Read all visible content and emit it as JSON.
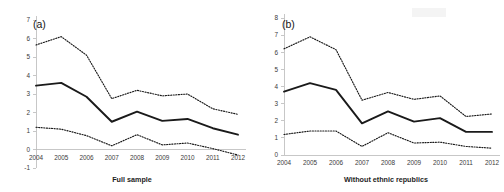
{
  "figure": {
    "width": 504,
    "height": 192,
    "background": "#ffffff",
    "line_color": "#1a1a1a",
    "axis_color": "#b9b9b9"
  },
  "panels": [
    {
      "tag": "(a)",
      "name": "panel-a",
      "caption": "Full sample"
    },
    {
      "tag": "(b)",
      "name": "panel-b",
      "caption": "Without ethnic republics"
    }
  ],
  "chart_data": [
    {
      "type": "line",
      "title": "(a)",
      "xlabel": "Full sample",
      "ylabel": "",
      "x": [
        2004,
        2005,
        2006,
        2007,
        2008,
        2009,
        2010,
        2011,
        2012
      ],
      "categories": [
        "2004",
        "2005",
        "2006",
        "2007",
        "2008",
        "2009",
        "2010",
        "2011",
        "2012"
      ],
      "xlim": [
        2004,
        2012
      ],
      "ylim": [
        -1,
        7
      ],
      "yticks": [
        -1,
        0,
        1,
        2,
        3,
        4,
        5,
        6,
        7
      ],
      "xticks": [
        "2004",
        "2005",
        "2006",
        "2007",
        "2008",
        "2009",
        "2010",
        "2011",
        "2012"
      ],
      "grid": false,
      "legend": "none",
      "series": [
        {
          "name": "Upper confidence bound",
          "style": "dotted",
          "values": [
            5.65,
            6.1,
            5.1,
            2.75,
            3.2,
            2.9,
            3.0,
            2.2,
            1.9
          ]
        },
        {
          "name": "Point estimate",
          "style": "solid",
          "values": [
            3.45,
            3.6,
            2.85,
            1.5,
            2.05,
            1.55,
            1.65,
            1.15,
            0.8
          ]
        },
        {
          "name": "Lower confidence bound",
          "style": "dotted",
          "values": [
            1.2,
            1.1,
            0.75,
            0.2,
            0.8,
            0.25,
            0.35,
            0.05,
            -0.3
          ]
        }
      ]
    },
    {
      "type": "line",
      "title": "(b)",
      "xlabel": "Without ethnic republics",
      "ylabel": "",
      "x": [
        2004,
        2005,
        2006,
        2007,
        2008,
        2009,
        2010,
        2011,
        2012
      ],
      "categories": [
        "2004",
        "2005",
        "2006",
        "2007",
        "2008",
        "2009",
        "2010",
        "2011",
        "2012"
      ],
      "xlim": [
        2004,
        2012
      ],
      "ylim": [
        0,
        8
      ],
      "yticks": [
        0,
        1,
        2,
        3,
        4,
        5,
        6,
        7,
        8
      ],
      "xticks": [
        "2004",
        "2005",
        "2006",
        "2007",
        "2008",
        "2009",
        "2010",
        "2011",
        "2012"
      ],
      "grid": false,
      "legend": "none",
      "series": [
        {
          "name": "Upper confidence bound",
          "style": "dotted",
          "values": [
            6.2,
            6.9,
            6.15,
            3.2,
            3.65,
            3.25,
            3.45,
            2.25,
            2.4
          ]
        },
        {
          "name": "Point estimate",
          "style": "solid",
          "values": [
            3.7,
            4.2,
            3.8,
            1.85,
            2.55,
            1.95,
            2.15,
            1.35,
            1.35
          ]
        },
        {
          "name": "Lower confidence bound",
          "style": "dotted",
          "values": [
            1.2,
            1.4,
            1.4,
            0.5,
            1.3,
            0.7,
            0.75,
            0.5,
            0.4
          ]
        }
      ]
    }
  ]
}
